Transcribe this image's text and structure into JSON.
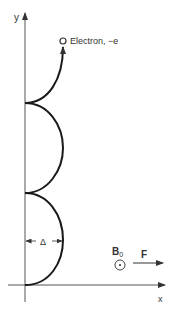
{
  "diagram": {
    "type": "particle-trajectory",
    "axes": {
      "x_label": "x",
      "y_label": "y"
    },
    "particle": {
      "label": "Electron, −e",
      "marker": "open-circle"
    },
    "field": {
      "label": "B",
      "subscript": "0",
      "direction_symbol": "dot-in-circle (out of page)"
    },
    "force": {
      "label": "F",
      "direction": "+x"
    },
    "dimension": {
      "label": "Δ",
      "meaning": "maximum excursion from y-axis"
    },
    "trajectory": {
      "segments": 3,
      "cusps_on_y_axis": 3,
      "final_segment_ends_with_arrow": true
    },
    "colors": {
      "stroke": "#1a1a1a",
      "axis": "#555555",
      "text": "#333333",
      "background": "#ffffff"
    }
  }
}
